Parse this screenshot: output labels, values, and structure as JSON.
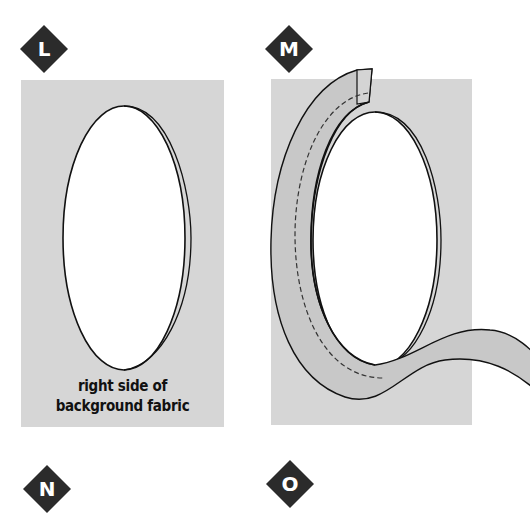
{
  "steps": [
    {
      "letter": "L",
      "label": "step-L"
    },
    {
      "letter": "M",
      "label": "step-M"
    },
    {
      "letter": "N",
      "label": "step-N"
    },
    {
      "letter": "O",
      "label": "step-O"
    }
  ],
  "panel_L": {
    "caption_line1": "right side of",
    "caption_line2": "background fabric"
  },
  "colors": {
    "badge_fill": "#2b2b2b",
    "panel_fill": "#d6d6d6",
    "ribbon_fill": "#c8c8c8",
    "oval_fill": "#ffffff",
    "line": "#111111"
  }
}
